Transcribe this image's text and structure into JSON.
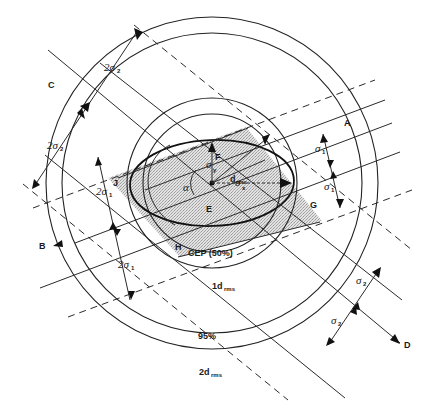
{
  "figure": {
    "center": {
      "label": "E",
      "x": 212,
      "y": 183
    },
    "points": {
      "A": "A",
      "B": "B",
      "C": "C",
      "D": "D",
      "E": "E",
      "F": "F",
      "G": "G",
      "H": "H",
      "J": "J"
    },
    "symbols": {
      "alpha": "α",
      "sigma_y": "σ",
      "sigma_y_sub": "y",
      "sigma_x": "σ",
      "sigma_x_sub": "x",
      "drms": "d",
      "drms_sub": "rms"
    },
    "circle_labels": {
      "cep": "CEP (50%)",
      "one_drms": "1d",
      "one_drms_sub": "rms",
      "p95": "95%",
      "two_drms": "2d",
      "two_drms_sub": "rms"
    },
    "dimension_labels": {
      "top_2sigma2": "2σ",
      "top_2sigma2_sub": "2",
      "left_2sigma2": "2σ",
      "left_2sigma2_sub": "2",
      "left_2sigma1": "2σ",
      "left_2sigma1_sub": "1",
      "left_2sigma_lower": "2σ",
      "left_2sigma_lower_sub": "1",
      "right_sigma1_upper": "σ",
      "right_sigma1_upper_sub": "1",
      "right_sigma1_lower": "σ",
      "right_sigma1_lower_sub": "1",
      "right_sigma2_upper": "σ",
      "right_sigma2_upper_sub": "2",
      "right_sigma2_lower": "σ",
      "right_sigma2_lower_sub": "2"
    },
    "colors": {
      "ink": "#1a1a1a",
      "shade": "#c8c8c8",
      "background": "#ffffff"
    }
  }
}
